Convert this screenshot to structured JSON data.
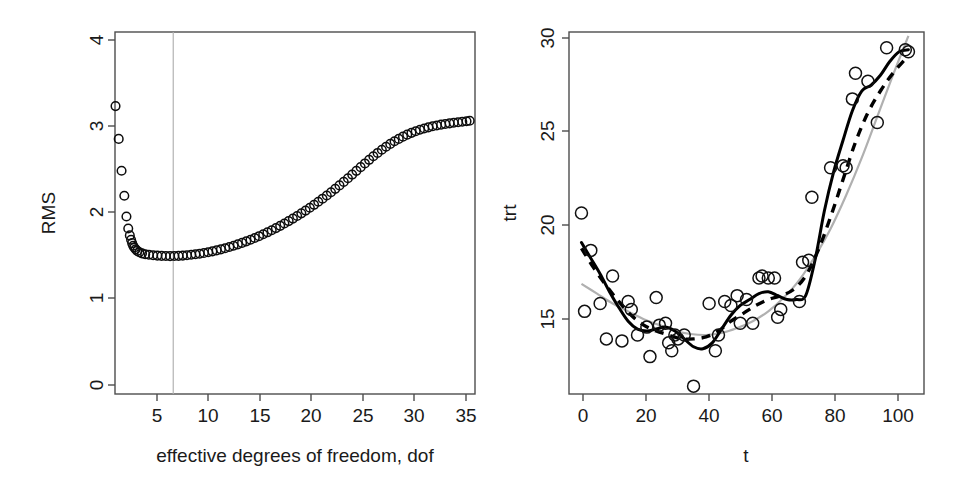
{
  "figure": {
    "width": 965,
    "height": 488,
    "background": "#ffffff",
    "panel_count": 2
  },
  "chart_data": [
    {
      "type": "scatter",
      "id": "rms-vs-dof",
      "title": "",
      "xlabel": "effective degrees of freedom, dof",
      "ylabel": "RMS",
      "xlim": [
        2.0,
        36.0
      ],
      "ylim": [
        0,
        4.2
      ],
      "xticks": [
        5,
        10,
        15,
        20,
        25,
        30,
        35
      ],
      "xtick_labels": [
        "5",
        "10",
        "15",
        "20",
        "25",
        "30",
        "35"
      ],
      "yticks": [
        0,
        1,
        2,
        3,
        4
      ],
      "ytick_labels": [
        "0",
        "1",
        "2",
        "3",
        "4"
      ],
      "grid": false,
      "legend": "none",
      "annotations": [
        {
          "kind": "vertical-line",
          "x": 7.5,
          "color": "#b3b3b3",
          "label": "selected dof"
        }
      ],
      "marker": "open-circle",
      "series": [
        {
          "name": "RMS",
          "x": [
            2.05,
            2.35,
            2.62,
            2.88,
            3.08,
            3.25,
            3.4,
            3.52,
            3.62,
            3.72,
            3.82,
            3.95,
            4.1,
            4.3,
            4.55,
            4.85,
            5.2,
            5.6,
            6.0,
            6.4,
            6.8,
            7.2,
            7.6,
            8.0,
            8.4,
            8.8,
            9.2,
            9.6,
            10.0,
            10.4,
            10.8,
            11.2,
            11.6,
            12.0,
            12.4,
            12.8,
            13.2,
            13.6,
            14.0,
            14.4,
            14.8,
            15.2,
            15.6,
            16.0,
            16.4,
            16.8,
            17.2,
            17.6,
            18.0,
            18.4,
            18.8,
            19.2,
            19.6,
            20.0,
            20.4,
            20.8,
            21.2,
            21.6,
            22.0,
            22.4,
            22.8,
            23.2,
            23.6,
            24.0,
            24.4,
            24.8,
            25.2,
            25.6,
            26.0,
            26.4,
            26.8,
            27.2,
            27.6,
            28.0,
            28.4,
            28.8,
            29.2,
            29.6,
            30.0,
            30.4,
            30.8,
            31.2,
            31.6,
            32.0,
            32.4,
            32.8,
            33.2,
            33.6,
            34.0,
            34.4,
            34.8,
            35.2,
            35.5
          ],
          "y": [
            3.34,
            2.96,
            2.59,
            2.3,
            2.06,
            1.92,
            1.84,
            1.79,
            1.75,
            1.72,
            1.7,
            1.68,
            1.66,
            1.645,
            1.632,
            1.622,
            1.615,
            1.61,
            1.606,
            1.603,
            1.601,
            1.6,
            1.601,
            1.603,
            1.606,
            1.61,
            1.615,
            1.621,
            1.628,
            1.636,
            1.645,
            1.655,
            1.666,
            1.678,
            1.691,
            1.705,
            1.72,
            1.736,
            1.753,
            1.771,
            1.79,
            1.81,
            1.831,
            1.853,
            1.876,
            1.9,
            1.925,
            1.951,
            1.978,
            2.006,
            2.035,
            2.065,
            2.096,
            2.128,
            2.161,
            2.195,
            2.23,
            2.266,
            2.303,
            2.341,
            2.38,
            2.42,
            2.461,
            2.503,
            2.546,
            2.589,
            2.632,
            2.675,
            2.717,
            2.758,
            2.797,
            2.834,
            2.869,
            2.902,
            2.932,
            2.96,
            2.986,
            3.009,
            3.03,
            3.049,
            3.066,
            3.081,
            3.094,
            3.106,
            3.116,
            3.125,
            3.133,
            3.14,
            3.147,
            3.153,
            3.159,
            3.165,
            3.17
          ]
        }
      ]
    },
    {
      "type": "scatter",
      "id": "trt-vs-t",
      "title": "",
      "xlabel": "t",
      "ylabel": "trt",
      "xlim": [
        -4,
        110
      ],
      "ylim": [
        12.0,
        30.4
      ],
      "xticks": [
        0,
        20,
        40,
        60,
        80,
        100
      ],
      "xtick_labels": [
        "0",
        "20",
        "40",
        "60",
        "80",
        "100"
      ],
      "yticks": [
        15,
        20,
        25,
        30
      ],
      "ytick_labels": [
        "15",
        "20",
        "25",
        "30"
      ],
      "grid": false,
      "legend": "none",
      "marker": "open-circle",
      "points": {
        "name": "trt observations",
        "x": [
          0,
          1,
          3,
          6,
          8,
          10,
          13,
          15,
          16,
          18,
          21,
          22,
          24,
          25,
          27,
          28,
          29,
          30,
          31,
          33,
          36,
          41,
          43,
          44,
          46,
          48,
          50,
          51,
          53,
          55,
          57,
          58,
          60,
          62,
          63,
          64,
          70,
          71,
          73,
          74,
          80,
          84,
          85,
          87,
          88,
          92,
          95,
          98,
          104,
          105
        ],
        "y": [
          21.2,
          16.2,
          19.3,
          16.6,
          14.8,
          18.0,
          14.7,
          16.7,
          16.3,
          15.0,
          15.4,
          13.9,
          16.9,
          15.5,
          15.6,
          14.6,
          14.2,
          15.0,
          14.8,
          15.0,
          12.4,
          16.6,
          14.2,
          15.0,
          16.7,
          16.5,
          17.0,
          15.6,
          16.8,
          15.6,
          17.9,
          18.0,
          17.9,
          17.9,
          15.9,
          16.3,
          16.7,
          18.7,
          18.8,
          22.0,
          23.5,
          23.6,
          23.5,
          27.0,
          28.3,
          27.9,
          25.8,
          29.6,
          29.5,
          29.4
        ]
      },
      "curves": [
        {
          "name": "smoothing-spline",
          "style": "solid",
          "color": "#000000",
          "x": [
            0,
            3,
            6,
            9,
            12,
            15,
            18,
            21,
            24,
            27,
            30,
            33,
            36,
            39,
            42,
            45,
            48,
            51,
            54,
            57,
            60,
            63,
            66,
            69,
            72,
            75,
            78,
            81,
            84,
            87,
            90,
            93,
            96,
            99,
            102,
            105
          ],
          "y": [
            19.7,
            18.9,
            18.1,
            17.2,
            16.4,
            15.7,
            15.3,
            15.2,
            15.3,
            15.4,
            15.2,
            14.8,
            14.4,
            14.3,
            14.6,
            15.3,
            16.0,
            16.5,
            16.8,
            17.1,
            17.2,
            17.0,
            16.8,
            16.8,
            17.0,
            18.8,
            21.3,
            23.3,
            24.9,
            26.4,
            27.4,
            27.7,
            28.2,
            28.9,
            29.4,
            29.5
          ]
        },
        {
          "name": "alternate-spline",
          "style": "dashed",
          "color": "#000000",
          "x": [
            0,
            4,
            8,
            12,
            16,
            20,
            24,
            28,
            32,
            36,
            40,
            44,
            48,
            52,
            56,
            60,
            64,
            68,
            72,
            76,
            80,
            84,
            88,
            92,
            96,
            100,
            105
          ],
          "y": [
            19.4,
            18.4,
            17.5,
            16.7,
            16.0,
            15.5,
            15.2,
            15.0,
            14.8,
            14.8,
            14.9,
            15.2,
            15.7,
            16.1,
            16.5,
            16.8,
            17.0,
            17.3,
            18.0,
            19.3,
            21.0,
            22.9,
            24.8,
            26.3,
            27.4,
            28.3,
            29.2
          ]
        },
        {
          "name": "low-dof-fit",
          "style": "solid-gray",
          "color": "#b0b0b0",
          "x": [
            0,
            5,
            10,
            15,
            20,
            25,
            30,
            35,
            40,
            45,
            50,
            55,
            60,
            65,
            70,
            75,
            80,
            85,
            90,
            95,
            100,
            105
          ],
          "y": [
            17.6,
            17.1,
            16.6,
            16.2,
            15.8,
            15.5,
            15.2,
            15.05,
            15.0,
            15.1,
            15.35,
            15.7,
            16.2,
            16.9,
            17.8,
            19.0,
            20.4,
            22.1,
            24.0,
            26.1,
            28.2,
            30.2
          ]
        }
      ]
    }
  ],
  "panels": {
    "left": {
      "name": "RMS versus effective degrees of freedom",
      "xlabel": "effective degrees of freedom, dof",
      "ylabel": "RMS",
      "xtick_labels": [
        "5",
        "10",
        "15",
        "20",
        "25",
        "30",
        "35"
      ],
      "ytick_labels": [
        "0",
        "1",
        "2",
        "3",
        "4"
      ]
    },
    "right": {
      "name": "trt versus t with three fitted curves",
      "xlabel": "t",
      "ylabel": "trt",
      "xtick_labels": [
        "0",
        "20",
        "40",
        "60",
        "80",
        "100"
      ],
      "ytick_labels": [
        "15",
        "20",
        "25",
        "30"
      ]
    }
  },
  "colors": {
    "axis": "#4d4d4d",
    "text": "#1a1a1a",
    "point": "#111111",
    "curve_solid": "#000000",
    "curve_dashed": "#000000",
    "curve_gray": "#b0b0b0",
    "vline": "#b3b3b3",
    "background": "#ffffff"
  }
}
